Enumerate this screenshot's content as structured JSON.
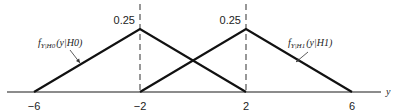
{
  "chart_data": {
    "type": "line",
    "title": "",
    "xlabel": "y",
    "ylabel": "",
    "xlim": [
      -6.5,
      7
    ],
    "ylim": [
      0,
      0.25
    ],
    "grid": false,
    "x_ticks": [
      "-6",
      "-2",
      "2",
      "6"
    ],
    "peak_labels": [
      "0.25",
      "0.25"
    ],
    "series": [
      {
        "name": "f_{Y|H0}(y|H0)",
        "label_main": "f",
        "label_sub": "Y|H0",
        "label_arg": "(y|H0)",
        "x": [
          -6,
          -2,
          2
        ],
        "values": [
          0,
          0.25,
          0
        ]
      },
      {
        "name": "f_{Y|H1}(y|H1)",
        "label_main": "f",
        "label_sub": "Y|H1",
        "label_arg": "(y|H1)",
        "x": [
          -2,
          2,
          6
        ],
        "values": [
          0,
          0.25,
          0
        ]
      }
    ],
    "dashed_verticals": [
      -2,
      2
    ]
  }
}
